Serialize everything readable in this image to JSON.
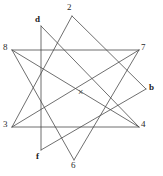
{
  "figure": {
    "background_color": "#ffffff",
    "line_color": "#4a4a4a",
    "line_width": 0.8,
    "width": 163,
    "height": 176,
    "center_marker": {
      "glyph": "×",
      "x": 78,
      "y": 88,
      "color": "#555555"
    },
    "vertices": [
      {
        "id": "v2",
        "label": "2",
        "x": 72,
        "y": 16,
        "label_x": 67,
        "label_y": 3,
        "bold": false
      },
      {
        "id": "v7",
        "label": "7",
        "x": 139,
        "y": 50,
        "label_x": 141,
        "label_y": 43,
        "bold": false
      },
      {
        "id": "vb",
        "label": "b",
        "x": 146,
        "y": 89,
        "label_x": 149,
        "label_y": 83,
        "bold": true
      },
      {
        "id": "v4",
        "label": "4",
        "x": 139,
        "y": 127,
        "label_x": 141,
        "label_y": 120,
        "bold": false
      },
      {
        "id": "v6",
        "label": "6",
        "x": 74,
        "y": 160,
        "label_x": 71,
        "label_y": 161,
        "bold": false
      },
      {
        "id": "vf",
        "label": "f",
        "x": 41,
        "y": 150,
        "label_x": 36,
        "label_y": 152,
        "bold": true
      },
      {
        "id": "v3",
        "label": "3",
        "x": 12,
        "y": 127,
        "label_x": 3,
        "label_y": 120,
        "bold": false
      },
      {
        "id": "v8",
        "label": "8",
        "x": 12,
        "y": 50,
        "label_x": 3,
        "label_y": 43,
        "bold": false
      },
      {
        "id": "vd",
        "label": "d",
        "x": 41,
        "y": 26,
        "label_x": 35,
        "label_y": 15,
        "bold": true
      }
    ],
    "edges": [
      {
        "from": "v2",
        "to": "vb"
      },
      {
        "from": "vb",
        "to": "vf"
      },
      {
        "from": "vf",
        "to": "vd"
      },
      {
        "from": "vd",
        "to": "v4"
      },
      {
        "from": "v4",
        "to": "v8"
      },
      {
        "from": "v8",
        "to": "v6"
      },
      {
        "from": "v6",
        "to": "v7"
      },
      {
        "from": "v7",
        "to": "v3"
      },
      {
        "from": "v3",
        "to": "v2"
      },
      {
        "from": "v8",
        "to": "v7"
      },
      {
        "from": "v3",
        "to": "v4"
      }
    ]
  }
}
